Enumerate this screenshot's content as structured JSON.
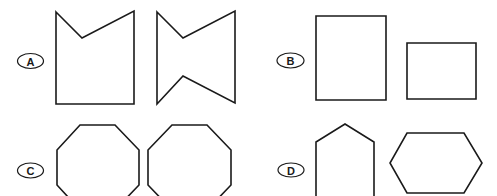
{
  "options": [
    {
      "label": "A",
      "label_pos": {
        "cx": 30.5,
        "cy": 61,
        "rx": 13,
        "ry": 7.5
      },
      "figures": [
        {
          "name": "pentagon-notched-top",
          "points": "56,12 82,38 134,11 134,104 56,104"
        },
        {
          "name": "bowtie-hexagon",
          "points": "157,12 183,38 235,11 235,103 183,76 157,104"
        }
      ]
    },
    {
      "label": "B",
      "label_pos": {
        "cx": 290.5,
        "cy": 60.5,
        "rx": 13.5,
        "ry": 7.5
      },
      "figures": [
        {
          "name": "tall-rectangle",
          "points": "316,16 386,16 386,100 316,100"
        },
        {
          "name": "wide-rectangle",
          "points": "407,43 476,43 476,99 407,99"
        }
      ]
    },
    {
      "label": "C",
      "label_pos": {
        "cx": 30.5,
        "cy": 170.5,
        "rx": 13,
        "ry": 7.5
      },
      "figures": [
        {
          "name": "octagon-left",
          "points": "80,125 115,125 139,150 139,185 115,210 80,210 57,185 57,150"
        },
        {
          "name": "octagon-right",
          "points": "172,125 207,125 231,150 231,185 207,210 172,210 148,185 148,150"
        }
      ]
    },
    {
      "label": "D",
      "label_pos": {
        "cx": 291,
        "cy": 170,
        "rx": 13,
        "ry": 7
      },
      "figures": [
        {
          "name": "pentagon-house",
          "points": "316,210 316,142 345,124 374,142 374,210"
        },
        {
          "name": "hexagon",
          "points": "407,133 464,133 482,163 464,193 407,193 390,163"
        }
      ]
    }
  ]
}
